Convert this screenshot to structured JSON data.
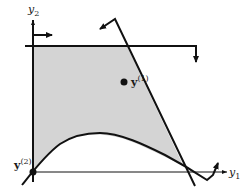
{
  "diagram": {
    "type": "feasible-region",
    "axes": {
      "x": {
        "label": "y",
        "subscript": "1"
      },
      "y": {
        "label": "y",
        "subscript": "2"
      }
    },
    "points": [
      {
        "id": "y1",
        "label": "y",
        "superscript": "(1)",
        "x": 124,
        "y": 82
      },
      {
        "id": "y2",
        "label": "y",
        "superscript": "(2)",
        "x": 33,
        "y": 172
      }
    ],
    "colors": {
      "region_fill": "#d4d4d4",
      "stroke": "#111111"
    }
  }
}
